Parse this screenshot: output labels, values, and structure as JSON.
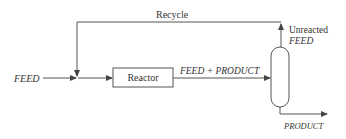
{
  "diagram": {
    "labels": {
      "recycle": "Recycle",
      "feed_in": "FEED",
      "reactor": "Reactor",
      "reactor_out": "FEED + PRODUCT",
      "unreacted_line1": "Unreacted",
      "unreacted_line2": "FEED",
      "product": "PRODUCT"
    },
    "nodes": [
      {
        "id": "mixer",
        "type": "junction"
      },
      {
        "id": "reactor",
        "type": "box",
        "label": "Reactor"
      },
      {
        "id": "separator",
        "type": "column"
      }
    ],
    "edges": [
      {
        "from": "input",
        "to": "mixer",
        "label": "FEED"
      },
      {
        "from": "mixer",
        "to": "reactor",
        "label": ""
      },
      {
        "from": "reactor",
        "to": "separator",
        "label": "FEED + PRODUCT"
      },
      {
        "from": "separator",
        "to": "mixer",
        "label": "Recycle / Unreacted FEED"
      },
      {
        "from": "separator",
        "to": "output",
        "label": "PRODUCT"
      }
    ],
    "colors": {
      "line": "#555555",
      "text": "#333333",
      "background": "#ffffff"
    }
  }
}
